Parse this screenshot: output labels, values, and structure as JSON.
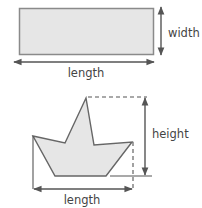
{
  "figure_top": {
    "shape": "rectangle",
    "labels": {
      "horizontal": "length",
      "vertical": "width"
    }
  },
  "figure_bottom": {
    "shape": "boat-polygon",
    "labels": {
      "horizontal": "length",
      "vertical": "height"
    }
  },
  "colors": {
    "fill": "#e6e6e6",
    "stroke": "#707070",
    "arrow": "#555555",
    "text": "#444444"
  }
}
